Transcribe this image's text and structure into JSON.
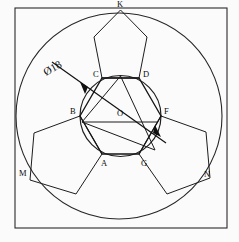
{
  "drawing": {
    "title": "Hexagon with three pentagons inscribed in circle",
    "canvas": {
      "width": 239,
      "height": 242
    },
    "colors": {
      "line": "#1a1a1a",
      "frame": "#2a2a2a",
      "background": "#fbfbfb",
      "text": "#0d0d0d"
    },
    "frame": {
      "x": 15,
      "y": 8,
      "width": 212,
      "height": 220
    },
    "outer_circle": {
      "cx": 119,
      "cy": 116,
      "r": 103
    },
    "inner_circle": {
      "cx": 120.5,
      "cy": 116,
      "r": 40.5
    },
    "hexagon": {
      "name": "ABCDFG",
      "points": "102,78 139,78 161,116 139,154 102,154 80,116"
    },
    "triangle": {
      "name": "inscribed-triangle",
      "points": "120.5,76 155,150 82,122"
    },
    "pentagon_top": {
      "apex_label": "K",
      "points": "102,78 139,78 147,37 120.5,10 94,37"
    },
    "pentagon_left": {
      "apex_label": "M",
      "points": "80,116 102,154 76,194 30,180 34,133"
    },
    "pentagon_right": {
      "apex_label": "N",
      "points": "161,116 139,154 167,194 210,178 206,132"
    },
    "chord_line": {
      "x1": 82,
      "y1": 122,
      "x2": 158,
      "y2": 122
    },
    "dimension": {
      "label": "Ø18",
      "label_x": 46,
      "label_y": 76,
      "rotation": -30,
      "leader": {
        "x1": 52,
        "y1": 62,
        "x2": 166,
        "y2": 143
      },
      "arrow_inner": {
        "x": 88,
        "y": 87
      },
      "arrow_outer": {
        "x": 153,
        "y": 133
      }
    },
    "vertex_labels": [
      {
        "id": "K",
        "text": "K",
        "x": 117,
        "y": 7
      },
      {
        "id": "C",
        "text": "C",
        "x": 93,
        "y": 77
      },
      {
        "id": "D",
        "text": "D",
        "x": 143,
        "y": 77
      },
      {
        "id": "B",
        "text": "B",
        "x": 70,
        "y": 114
      },
      {
        "id": "O",
        "text": "O",
        "x": 117,
        "y": 116
      },
      {
        "id": "F",
        "text": "F",
        "x": 164,
        "y": 114
      },
      {
        "id": "A",
        "text": "A",
        "x": 101,
        "y": 166
      },
      {
        "id": "G",
        "text": "G",
        "x": 141,
        "y": 166
      },
      {
        "id": "M",
        "text": "M",
        "x": 19,
        "y": 176
      },
      {
        "id": "N",
        "text": "N",
        "x": 204,
        "y": 177
      }
    ]
  }
}
